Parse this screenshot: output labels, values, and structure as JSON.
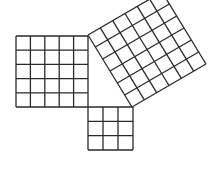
{
  "diagram": {
    "title": "",
    "stroke_color": "#2a2a2a",
    "background": "#ffffff",
    "squares": [
      {
        "name": "left-square",
        "cells": 5,
        "corner": [
          16,
          36
        ],
        "u": [
          72,
          0
        ],
        "v": [
          0,
          71
        ]
      },
      {
        "name": "bottom-square",
        "cells": 3,
        "corner": [
          88,
          107
        ],
        "u": [
          45,
          0
        ],
        "v": [
          0,
          43
        ]
      },
      {
        "name": "rotated-square",
        "cells": 6,
        "corner": [
          88,
          35
        ],
        "u": [
          74,
          -43
        ],
        "v": [
          44,
          72
        ]
      }
    ]
  }
}
